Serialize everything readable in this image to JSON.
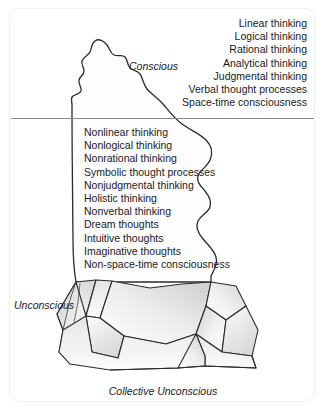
{
  "figure": {
    "waterline_color": "#8a8a8a",
    "outline_color": "#2b2b2b",
    "ice_fill_light": "#fdfdfd",
    "ice_fill_shade": "#d9d9d9",
    "text_color": "#1a1a1a",
    "frame_color": "#f0f0f0"
  },
  "labels": {
    "conscious": "Conscious",
    "unconscious": "Unconscious",
    "collective_unconscious": "Collective Unconscious"
  },
  "conscious": {
    "items": [
      "Linear thinking",
      "Logical thinking",
      "Rational thinking",
      "Analytical thinking",
      "Judgmental thinking",
      "Verbal thought processes",
      "Space-time consciousness"
    ]
  },
  "unconscious": {
    "items": [
      "Nonlinear thinking",
      "Nonlogical thinking",
      "Nonrational thinking",
      "Symbolic thought processes",
      "Nonjudgmental thinking",
      "Holistic thinking",
      "Nonverbal thinking",
      "Dream thoughts",
      "Intuitive thoughts",
      "Imaginative thoughts",
      "Non-space-time consciousness"
    ]
  }
}
